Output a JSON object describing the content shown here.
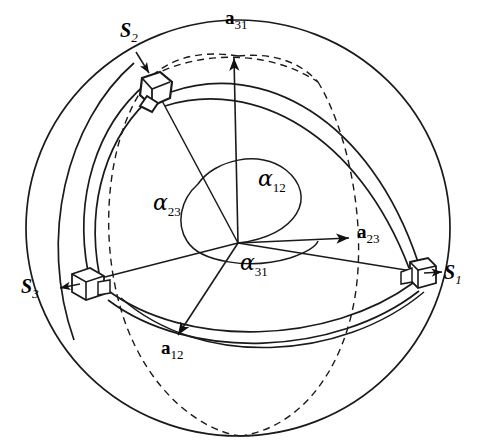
{
  "figure": {
    "background_color": "#ffffff",
    "line_color": "#1a1a1a"
  },
  "sphere": {
    "center_x": 238,
    "center_y": 228,
    "radius_x": 212,
    "radius_y": 208
  },
  "origin": {
    "x": 238,
    "y": 243,
    "label": "sphere-center"
  },
  "joints": [
    {
      "id": "S1",
      "label_base": "S",
      "label_sub": "1",
      "label_x": 447,
      "label_y": 272,
      "box_x": 413,
      "box_y": 262,
      "arrow_from_x": 424,
      "arrow_from_y": 272,
      "arrow_to_x": 443,
      "arrow_to_y": 272
    },
    {
      "id": "S2",
      "label_base": "S",
      "label_sub": "2",
      "label_x": 123,
      "label_y": 28,
      "box_x": 144,
      "box_y": 82,
      "arrow_from_x": 138,
      "arrow_from_y": 55,
      "arrow_to_x": 148,
      "arrow_to_y": 74
    },
    {
      "id": "S3",
      "label_base": "S",
      "label_sub": "3",
      "label_x": 24,
      "label_y": 286,
      "box_x": 85,
      "box_y": 272,
      "arrow_from_x": 80,
      "arrow_from_y": 283,
      "arrow_to_x": 60,
      "arrow_to_y": 287
    }
  ],
  "vectors": [
    {
      "id": "a31",
      "label_base": "a",
      "label_sub": "31",
      "label_x": 228,
      "label_y": 14,
      "from_x": 238,
      "from_y": 243,
      "to_x": 234,
      "to_y": 56,
      "direction": "up"
    },
    {
      "id": "a23",
      "label_base": "a",
      "label_sub": "23",
      "label_x": 359,
      "label_y": 228,
      "from_x": 238,
      "from_y": 243,
      "to_x": 351,
      "to_y": 238,
      "direction": "right"
    },
    {
      "id": "a12",
      "label_base": "a",
      "label_sub": "12",
      "label_x": 163,
      "label_y": 345,
      "from_x": 238,
      "from_y": 243,
      "to_x": 176,
      "to_y": 337,
      "direction": "down-left"
    }
  ],
  "angles": [
    {
      "id": "alpha12",
      "label_base": "α",
      "label_sub": "12",
      "label_x": 259,
      "label_y": 175,
      "description": "arc between S1 and S2 axes"
    },
    {
      "id": "alpha23",
      "label_base": "α",
      "label_sub": "23",
      "label_x": 155,
      "label_y": 197,
      "description": "arc between S2 and S3 axes"
    },
    {
      "id": "alpha31",
      "label_base": "α",
      "label_sub": "31",
      "label_x": 241,
      "label_y": 258,
      "description": "arc between S3 and S1 axes"
    }
  ],
  "links": [
    {
      "id": "link-S2-S1",
      "from": "S2",
      "to": "S1",
      "style": "solid-band"
    },
    {
      "id": "link-S3-S1",
      "from": "S3",
      "to": "S1",
      "style": "solid-band"
    },
    {
      "id": "link-S3-S2",
      "from": "S3",
      "to": "S2",
      "style": "solid-band"
    }
  ],
  "meridians": [
    {
      "id": "meridian-front-left",
      "style": "dashed"
    },
    {
      "id": "meridian-front-right",
      "style": "dashed"
    },
    {
      "id": "meridian-top-arc",
      "style": "dashed"
    }
  ]
}
